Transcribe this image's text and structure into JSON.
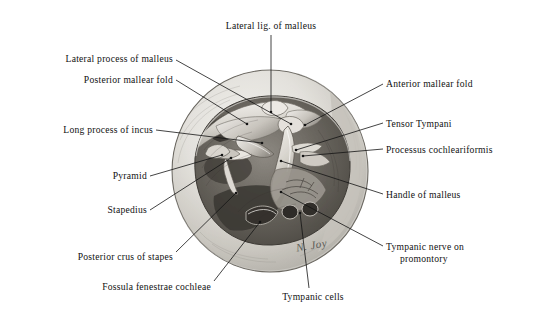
{
  "figure": {
    "signature": "N. Joy",
    "background_color": "#ffffff",
    "ink_color": "#111111",
    "oval": {
      "cx": 270,
      "cy": 171,
      "rx": 98,
      "ry": 101,
      "fill_light": "#e8e7e3",
      "fill_mid": "#b9b7b1",
      "outline": "#5a5853"
    }
  },
  "labels": [
    {
      "id": "lateral-lig-of-malleus",
      "text": "Lateral lig. of malleus",
      "align": "center",
      "x": 199,
      "y": 20,
      "w": 144,
      "leader": {
        "x1": 271,
        "y1": 35,
        "x2": 271,
        "y2": 112
      }
    },
    {
      "id": "lateral-process-of-malleus",
      "text": "Lateral process of malleus",
      "align": "left",
      "x": 30,
      "y": 53,
      "w": 143,
      "leader": {
        "x1": 176,
        "y1": 60,
        "x2": 291,
        "y2": 124
      }
    },
    {
      "id": "posterior-mallear-fold",
      "text": "Posterior mallear fold",
      "align": "left",
      "x": 50,
      "y": 74,
      "w": 123,
      "leader": {
        "x1": 176,
        "y1": 80,
        "x2": 247,
        "y2": 124
      }
    },
    {
      "id": "anterior-mallear-fold",
      "text": "Anterior mallear fold",
      "align": "right",
      "x": 386,
      "y": 78,
      "w": 140,
      "leader": {
        "x1": 383,
        "y1": 84,
        "x2": 305,
        "y2": 125
      }
    },
    {
      "id": "tensor-tympani",
      "text": "Tensor Tympani",
      "align": "right",
      "x": 386,
      "y": 118,
      "w": 140,
      "leader": {
        "x1": 383,
        "y1": 123,
        "x2": 296,
        "y2": 150
      }
    },
    {
      "id": "long-process-of-incus",
      "text": "Long process of incus",
      "align": "left",
      "x": 26,
      "y": 124,
      "w": 127,
      "leader": {
        "x1": 156,
        "y1": 130,
        "x2": 262,
        "y2": 143
      }
    },
    {
      "id": "processus-cochleariformis",
      "text": "Processus cochleariformis",
      "align": "right",
      "x": 386,
      "y": 144,
      "w": 152,
      "leader": {
        "x1": 383,
        "y1": 149,
        "x2": 303,
        "y2": 156
      }
    },
    {
      "id": "pyramid",
      "text": "Pyramid",
      "align": "left",
      "x": 82,
      "y": 170,
      "w": 65,
      "leader": {
        "x1": 150,
        "y1": 176,
        "x2": 222,
        "y2": 155
      }
    },
    {
      "id": "handle-of-malleus",
      "text": "Handle of malleus",
      "align": "right",
      "x": 386,
      "y": 189,
      "w": 140,
      "leader": {
        "x1": 383,
        "y1": 194,
        "x2": 281,
        "y2": 161
      }
    },
    {
      "id": "stapedius",
      "text": "Stapedius",
      "align": "left",
      "x": 82,
      "y": 204,
      "w": 65,
      "leader": {
        "x1": 150,
        "y1": 210,
        "x2": 231,
        "y2": 158
      }
    },
    {
      "id": "tympanic-nerve-on-promontory",
      "text": "Tympanic nerve on",
      "text2": "promontory",
      "align": "right",
      "x": 386,
      "y": 241,
      "w": 152,
      "leader": {
        "x1": 383,
        "y1": 246,
        "x2": 281,
        "y2": 192
      }
    },
    {
      "id": "posterior-crus-of-stapes",
      "text": "Posterior crus of stapes",
      "align": "left",
      "x": 41,
      "y": 251,
      "w": 132,
      "leader": {
        "x1": 176,
        "y1": 252,
        "x2": 236,
        "y2": 193
      }
    },
    {
      "id": "fossula-fenestrae-cochleae",
      "text": "Fossula fenestrae cochleae",
      "align": "left",
      "x": 58,
      "y": 281,
      "w": 153,
      "leader": {
        "x1": 214,
        "y1": 281,
        "x2": 260,
        "y2": 222
      }
    },
    {
      "id": "tympanic-cells",
      "text": "Tympanic cells",
      "align": "center",
      "x": 263,
      "y": 291,
      "w": 100,
      "leader": {
        "x1": 309,
        "y1": 288,
        "x2": 300,
        "y2": 213
      }
    }
  ]
}
